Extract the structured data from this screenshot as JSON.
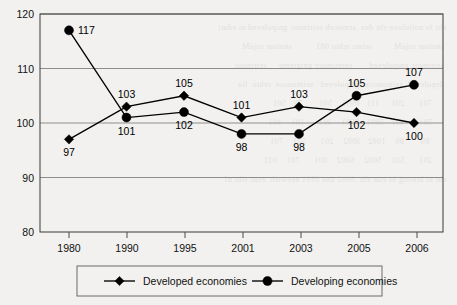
{
  "chart_data": {
    "type": "line",
    "title": "",
    "xlabel": "",
    "ylabel": "",
    "categories": [
      "1980",
      "1990",
      "1995",
      "2001",
      "2003",
      "2005",
      "2006"
    ],
    "ylim": [
      80,
      120
    ],
    "yticks": [
      80,
      90,
      100,
      110,
      120
    ],
    "grid": true,
    "legend_position": "bottom",
    "series": [
      {
        "name": "Developed economies",
        "marker": "diamond",
        "values": [
          97,
          103,
          105,
          101,
          103,
          102,
          100
        ],
        "label_positions": [
          "below",
          "above",
          "above",
          "above",
          "above",
          "below",
          "below"
        ]
      },
      {
        "name": "Developing economies",
        "marker": "circle",
        "values": [
          117,
          101,
          102,
          98,
          98,
          105,
          107
        ],
        "label_positions": [
          "right",
          "below",
          "below",
          "below",
          "below",
          "above",
          "above"
        ]
      }
    ]
  },
  "legend": {
    "items": [
      {
        "label": "Developed economies",
        "marker": "diamond"
      },
      {
        "label": "Developing economies",
        "marker": "circle"
      }
    ]
  },
  "colors": {
    "series_line": "#000000",
    "marker": "#000000",
    "gridline": "#8e8e8e",
    "frame": "#4a4a4a",
    "background": "#f2f1ef",
    "text": "#111111"
  },
  "ghost_text": "  eht fo noitulove eht dna ,semoceb seirtnuoc gnipoleved ni edart\n   snoitan rojaM         setats rehto 081          snoitan rojaM\n   seirtnuoc gnipoleved       seimonoce gnigreme     seirtnuoc\n   depoleved  seimonoce  gnipoleved   seimonoce  rehto  lla\n        701      201     111   0991    501       79   501\n        501      301   5991   8991    301      101    401\n         89       89    1002   3002    201      501    701\n        201      501    5002    6002    001      701    011\n  eht ni htworg fo etar eht ,6002 dna 0891 neewteb ,esac siht nI"
}
